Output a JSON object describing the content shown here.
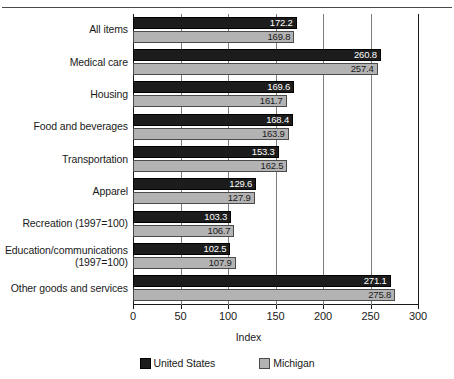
{
  "chart_data": {
    "type": "bar",
    "orientation": "horizontal",
    "title": "",
    "xlabel": "Index",
    "ylabel": "",
    "xlim": [
      0,
      300
    ],
    "xticks": [
      0,
      50,
      100,
      150,
      200,
      250,
      300
    ],
    "xtick_labels": [
      "0",
      "50",
      "100",
      "150",
      "200",
      "250",
      "300"
    ],
    "grid": true,
    "grid_axis": "x",
    "legend_position": "bottom-center",
    "categories": [
      "All items",
      "Medical care",
      "Housing",
      "Food and beverages",
      "Transportation",
      "Apparel",
      "Recreation (1997=100)",
      "Education/communications\n(1997=100)",
      "Other goods and services"
    ],
    "series": [
      {
        "name": "United States",
        "color": "#1c1c1c",
        "values": [
          172.2,
          260.8,
          169.6,
          168.4,
          153.3,
          129.6,
          103.3,
          102.5,
          271.1
        ],
        "value_labels": [
          "172.2",
          "260.8",
          "169.6",
          "168.4",
          "153.3",
          "129.6",
          "103.3",
          "102.5",
          "271.1"
        ]
      },
      {
        "name": "Michigan",
        "color": "#b3b3b3",
        "values": [
          169.8,
          257.4,
          161.7,
          163.9,
          162.5,
          127.9,
          106.7,
          107.9,
          275.8
        ],
        "value_labels": [
          "169.8",
          "257.4",
          "161.7",
          "163.9",
          "162.5",
          "127.9",
          "106.7",
          "107.9",
          "275.8"
        ]
      }
    ]
  },
  "legend": {
    "items": [
      {
        "label": "United States",
        "swatch": "us"
      },
      {
        "label": "Michigan",
        "swatch": "mi"
      }
    ]
  }
}
